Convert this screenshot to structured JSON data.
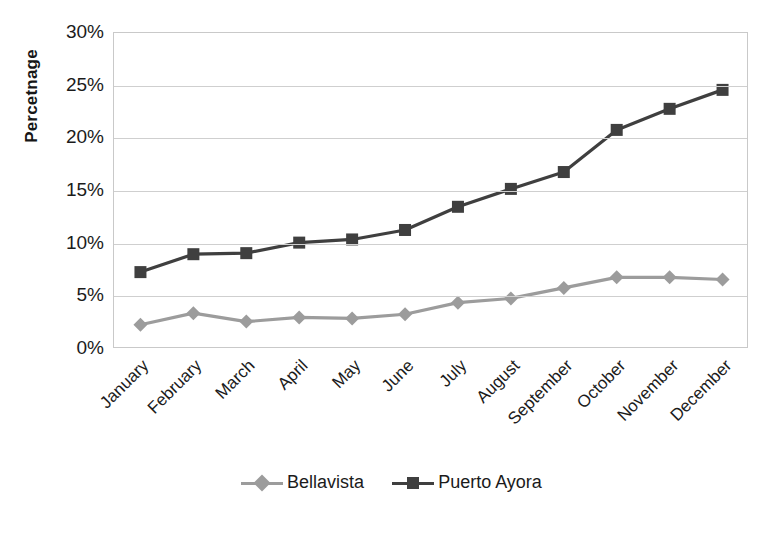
{
  "chart_data": {
    "type": "line",
    "title": "",
    "xlabel": "",
    "ylabel": "Percetnage",
    "categories": [
      "January",
      "February",
      "March",
      "April",
      "May",
      "June",
      "July",
      "August",
      "September",
      "October",
      "November",
      "December"
    ],
    "ylim": [
      0,
      30
    ],
    "ytick_values": [
      0,
      5,
      10,
      15,
      20,
      25,
      30
    ],
    "ytick_labels": [
      "0%",
      "5%",
      "10%",
      "15%",
      "20%",
      "25%",
      "30%"
    ],
    "grid": "horizontal",
    "legend_position": "bottom-center",
    "series": [
      {
        "name": "Bellavista",
        "color": "#9c9c9c",
        "marker": "diamond",
        "values": [
          2.3,
          3.4,
          2.6,
          3.0,
          2.9,
          3.3,
          4.4,
          4.8,
          5.8,
          6.8,
          6.8,
          6.6
        ]
      },
      {
        "name": "Puerto Ayora",
        "color": "#3f3f3f",
        "marker": "square",
        "values": [
          7.3,
          9.0,
          9.1,
          10.1,
          10.4,
          11.3,
          13.5,
          15.2,
          16.8,
          20.8,
          22.8,
          24.6
        ]
      }
    ]
  },
  "legend": {
    "items": [
      {
        "label": "Bellavista"
      },
      {
        "label": "Puerto Ayora"
      }
    ]
  },
  "axis": {
    "y_title": "Percetnage"
  }
}
